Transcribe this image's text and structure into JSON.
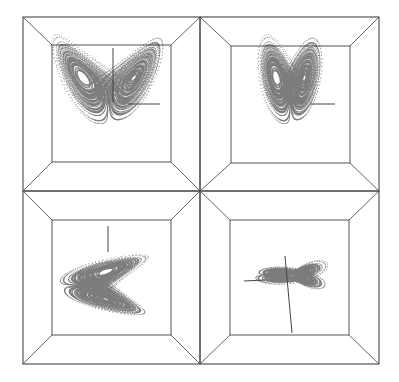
{
  "figure": {
    "width": 399,
    "height": 382,
    "background": "#ffffff",
    "frame_color": "#555555",
    "point_color": "#111111",
    "axis_color": "#444444",
    "divider": {
      "x": 200,
      "y": 191
    },
    "outer": {
      "x0": 23,
      "y0": 17,
      "x1": 379,
      "y1": 364
    }
  },
  "attractor": {
    "name": "Lorenz attractor",
    "sigma": 10,
    "rho": 28,
    "beta": 2.6667,
    "steps": 16000,
    "dt": 0.006
  },
  "panels": [
    {
      "id": "view-top-left",
      "outer": [
        23,
        17,
        200,
        191
      ],
      "inner": [
        52,
        45,
        171,
        162
      ],
      "projection": "xz",
      "center": [
        108,
        82
      ],
      "scale": [
        3.0,
        -2.1
      ],
      "z_offset": 25,
      "axes": [
        {
          "x1": 113,
          "y1": 48,
          "x2": 113,
          "y2": 102
        },
        {
          "x1": 128,
          "y1": 104,
          "x2": 160,
          "y2": 104
        }
      ]
    },
    {
      "id": "view-top-right",
      "outer": [
        200,
        17,
        379,
        191
      ],
      "inner": [
        231,
        46,
        350,
        163
      ],
      "projection": "yz-narrow",
      "center": [
        290,
        82
      ],
      "scale": [
        1.3,
        -2.1
      ],
      "z_offset": 25,
      "axes": [
        {
          "x1": 310,
          "y1": 104,
          "x2": 335,
          "y2": 104
        }
      ]
    },
    {
      "id": "view-bottom-left",
      "outer": [
        23,
        191,
        200,
        364
      ],
      "inner": [
        52,
        220,
        171,
        335
      ],
      "projection": "zx-side",
      "center": [
        95,
        285
      ],
      "scale": [
        2.3,
        1.8
      ],
      "z_offset": 25,
      "axes": [
        {
          "x1": 108,
          "y1": 226,
          "x2": 108,
          "y2": 252
        }
      ]
    },
    {
      "id": "view-bottom-right",
      "outer": [
        200,
        191,
        379,
        364
      ],
      "inner": [
        230,
        220,
        349,
        335
      ],
      "projection": "edge",
      "center": [
        285,
        275
      ],
      "scale": [
        2.0,
        1.0
      ],
      "z_offset": 25,
      "axes": [
        {
          "x1": 285,
          "y1": 256,
          "x2": 292,
          "y2": 333
        },
        {
          "x1": 244,
          "y1": 281,
          "x2": 265,
          "y2": 280
        }
      ]
    }
  ]
}
